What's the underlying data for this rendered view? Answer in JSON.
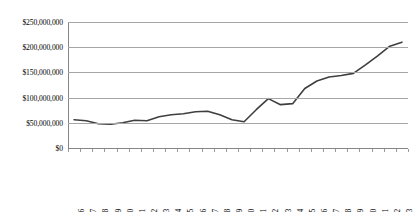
{
  "chart_data": {
    "type": "line",
    "title": "",
    "xlabel": "",
    "ylabel": "",
    "ylim": [
      0,
      250000000
    ],
    "ytick_labels": [
      "$250,000,000",
      "$200,000,000",
      "$150,000,000",
      "$100,000,000",
      "$50,000,000",
      "$0"
    ],
    "ytick_values": [
      250000000,
      200000000,
      150000000,
      100000000,
      50000000,
      0
    ],
    "grid": true,
    "legend": false,
    "categories": [
      "1985-86",
      "1986-87",
      "1987-88",
      "1988-89",
      "1989-90",
      "1990-91",
      "1991-92",
      "1992-93",
      "1993-94",
      "1994-95",
      "1995-96",
      "1996-97",
      "1997-98",
      "1998-99",
      "1999-2000",
      "2000-01",
      "2001-02",
      "2002-03",
      "2003-04",
      "2004-05",
      "2005-06",
      "2006-07",
      "2007-08",
      "2008-09",
      "2009-10",
      "2010-11",
      "2011-12",
      "2012-13"
    ],
    "values": [
      56000000,
      54000000,
      48000000,
      47000000,
      50000000,
      55000000,
      54000000,
      62000000,
      66000000,
      68000000,
      72000000,
      73000000,
      66000000,
      56000000,
      52000000,
      76000000,
      98000000,
      86000000,
      88000000,
      118000000,
      133000000,
      141000000,
      144000000,
      148000000,
      165000000,
      183000000,
      202000000,
      210000000
    ],
    "line_color": "#3f3f3f",
    "grid_color": "#a6a6a6"
  }
}
